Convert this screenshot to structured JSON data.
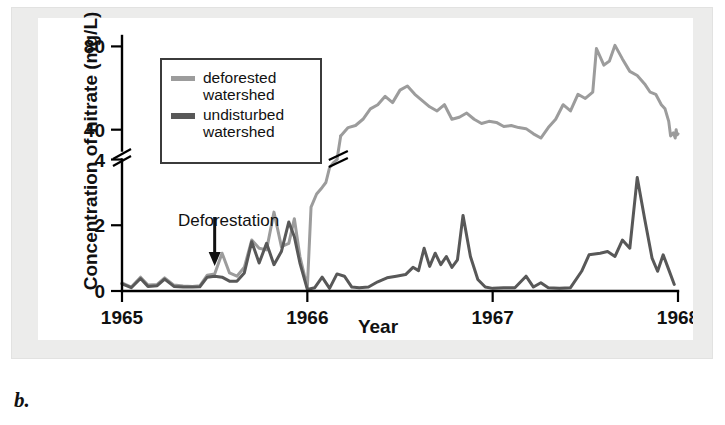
{
  "figure": {
    "panel_label": "b.",
    "legend": {
      "entries": [
        {
          "label_line1": "deforested",
          "label_line2": "watershed",
          "color": "#9c9c9c",
          "name": "deforested-watershed"
        },
        {
          "label_line1": "undisturbed",
          "label_line2": "watershed",
          "color": "#585858",
          "name": "undisturbed-watershed"
        }
      ]
    },
    "annotation": {
      "text": "Deforestation",
      "arrow": "down-arrow",
      "points_to_year": 1965.5
    },
    "colors": {
      "deforested": "#9c9c9c",
      "undisturbed": "#585858",
      "axis": "#000000",
      "frame_background": "#ececeb",
      "plot_background": "#ffffff"
    }
  },
  "chart_data": {
    "type": "line",
    "title": "",
    "xlabel": "Year",
    "ylabel": "Concentration of nitrate (mg/L)",
    "xlim": [
      1965.0,
      1968.0
    ],
    "x_ticks": [
      1965,
      1966,
      1967,
      1968
    ],
    "x_tick_labels": [
      "1965",
      "1966",
      "1967",
      "1968"
    ],
    "y_ticks_lower": [
      0,
      2,
      4
    ],
    "y_ticks_upper": [
      40,
      80
    ],
    "y_tick_labels": [
      "0",
      "2",
      "4",
      "40",
      "80"
    ],
    "axis_break": true,
    "axis_break_note": "y-axis is broken between 4 and 40 mg/L; lower segment spans 0-4, upper segment spans ~30-80",
    "ylim_lower": [
      0,
      4
    ],
    "ylim_upper": [
      30,
      85
    ],
    "grid": false,
    "legend_position": "upper-left-inside",
    "series": [
      {
        "name": "deforested watershed",
        "color": "#9c9c9c",
        "points": [
          [
            1965.0,
            0.25
          ],
          [
            1965.05,
            0.12
          ],
          [
            1965.1,
            0.42
          ],
          [
            1965.14,
            0.18
          ],
          [
            1965.19,
            0.2
          ],
          [
            1965.23,
            0.4
          ],
          [
            1965.28,
            0.18
          ],
          [
            1965.33,
            0.15
          ],
          [
            1965.38,
            0.14
          ],
          [
            1965.42,
            0.16
          ],
          [
            1965.46,
            0.48
          ],
          [
            1965.5,
            0.52
          ],
          [
            1965.54,
            1.15
          ],
          [
            1965.58,
            0.55
          ],
          [
            1965.62,
            0.45
          ],
          [
            1965.66,
            0.72
          ],
          [
            1965.7,
            1.55
          ],
          [
            1965.74,
            1.3
          ],
          [
            1965.78,
            1.25
          ],
          [
            1965.82,
            2.4
          ],
          [
            1965.86,
            1.35
          ],
          [
            1965.9,
            1.45
          ],
          [
            1965.93,
            2.2
          ],
          [
            1965.96,
            1.05
          ],
          [
            1966.0,
            0.1
          ],
          [
            1966.02,
            2.55
          ],
          [
            1966.05,
            2.95
          ],
          [
            1966.08,
            3.15
          ],
          [
            1966.1,
            3.3
          ],
          [
            1966.12,
            3.75
          ],
          [
            1966.14,
            3.9
          ],
          [
            1966.16,
            4.0
          ],
          [
            1966.18,
            37.0
          ],
          [
            1966.22,
            41.0
          ],
          [
            1966.26,
            42.0
          ],
          [
            1966.3,
            45.0
          ],
          [
            1966.34,
            50.0
          ],
          [
            1966.38,
            52.0
          ],
          [
            1966.42,
            56.0
          ],
          [
            1966.46,
            53.0
          ],
          [
            1966.5,
            59.0
          ],
          [
            1966.54,
            61.0
          ],
          [
            1966.58,
            57.0
          ],
          [
            1966.62,
            54.0
          ],
          [
            1966.66,
            51.0
          ],
          [
            1966.7,
            49.0
          ],
          [
            1966.74,
            52.0
          ],
          [
            1966.78,
            45.0
          ],
          [
            1966.82,
            46.0
          ],
          [
            1966.86,
            48.0
          ],
          [
            1966.9,
            45.0
          ],
          [
            1966.94,
            43.0
          ],
          [
            1966.98,
            44.0
          ],
          [
            1967.02,
            43.5
          ],
          [
            1967.06,
            41.5
          ],
          [
            1967.1,
            42.0
          ],
          [
            1967.14,
            41.0
          ],
          [
            1967.18,
            40.5
          ],
          [
            1967.22,
            38.0
          ],
          [
            1967.26,
            36.0
          ],
          [
            1967.3,
            41.0
          ],
          [
            1967.34,
            45.0
          ],
          [
            1967.38,
            52.0
          ],
          [
            1967.42,
            49.0
          ],
          [
            1967.46,
            57.0
          ],
          [
            1967.5,
            55.0
          ],
          [
            1967.54,
            58.0
          ],
          [
            1967.56,
            79.0
          ],
          [
            1967.6,
            71.0
          ],
          [
            1967.63,
            73.0
          ],
          [
            1967.66,
            80.5
          ],
          [
            1967.7,
            74.0
          ],
          [
            1967.74,
            68.0
          ],
          [
            1967.78,
            66.0
          ],
          [
            1967.82,
            62.0
          ],
          [
            1967.85,
            58.0
          ],
          [
            1967.88,
            57.0
          ],
          [
            1967.91,
            52.0
          ],
          [
            1967.93,
            50.0
          ],
          [
            1967.95,
            44.0
          ],
          [
            1967.96,
            37.0
          ],
          [
            1967.975,
            38.5
          ],
          [
            1967.985,
            36.0
          ],
          [
            1967.99,
            40.0
          ],
          [
            1967.995,
            37.5
          ],
          [
            1968.0,
            38.0
          ]
        ]
      },
      {
        "name": "undisturbed watershed",
        "color": "#585858",
        "points": [
          [
            1965.0,
            0.22
          ],
          [
            1965.05,
            0.1
          ],
          [
            1965.1,
            0.38
          ],
          [
            1965.14,
            0.14
          ],
          [
            1965.19,
            0.16
          ],
          [
            1965.23,
            0.36
          ],
          [
            1965.28,
            0.14
          ],
          [
            1965.33,
            0.12
          ],
          [
            1965.38,
            0.12
          ],
          [
            1965.42,
            0.13
          ],
          [
            1965.46,
            0.42
          ],
          [
            1965.5,
            0.45
          ],
          [
            1965.54,
            0.42
          ],
          [
            1965.58,
            0.3
          ],
          [
            1965.62,
            0.3
          ],
          [
            1965.66,
            0.55
          ],
          [
            1965.7,
            1.5
          ],
          [
            1965.74,
            0.85
          ],
          [
            1965.78,
            1.45
          ],
          [
            1965.82,
            0.8
          ],
          [
            1965.86,
            1.2
          ],
          [
            1965.9,
            2.1
          ],
          [
            1965.93,
            1.65
          ],
          [
            1965.96,
            0.85
          ],
          [
            1966.0,
            0.05
          ],
          [
            1966.04,
            0.1
          ],
          [
            1966.08,
            0.42
          ],
          [
            1966.12,
            0.08
          ],
          [
            1966.16,
            0.52
          ],
          [
            1966.2,
            0.45
          ],
          [
            1966.24,
            0.12
          ],
          [
            1966.28,
            0.1
          ],
          [
            1966.33,
            0.12
          ],
          [
            1966.38,
            0.28
          ],
          [
            1966.43,
            0.4
          ],
          [
            1966.48,
            0.45
          ],
          [
            1966.53,
            0.5
          ],
          [
            1966.57,
            0.72
          ],
          [
            1966.6,
            0.62
          ],
          [
            1966.63,
            1.3
          ],
          [
            1966.66,
            0.75
          ],
          [
            1966.69,
            1.15
          ],
          [
            1966.72,
            0.8
          ],
          [
            1966.75,
            1.05
          ],
          [
            1966.78,
            0.72
          ],
          [
            1966.81,
            0.95
          ],
          [
            1966.84,
            2.3
          ],
          [
            1966.88,
            1.05
          ],
          [
            1966.92,
            0.35
          ],
          [
            1966.96,
            0.12
          ],
          [
            1967.0,
            0.08
          ],
          [
            1967.06,
            0.1
          ],
          [
            1967.12,
            0.1
          ],
          [
            1967.18,
            0.45
          ],
          [
            1967.22,
            0.12
          ],
          [
            1967.26,
            0.25
          ],
          [
            1967.3,
            0.1
          ],
          [
            1967.36,
            0.08
          ],
          [
            1967.42,
            0.1
          ],
          [
            1967.48,
            0.6
          ],
          [
            1967.52,
            1.1
          ],
          [
            1967.58,
            1.15
          ],
          [
            1967.62,
            1.2
          ],
          [
            1967.66,
            1.05
          ],
          [
            1967.7,
            1.55
          ],
          [
            1967.74,
            1.3
          ],
          [
            1967.78,
            3.45
          ],
          [
            1967.82,
            2.2
          ],
          [
            1967.86,
            1.0
          ],
          [
            1967.89,
            0.6
          ],
          [
            1967.92,
            1.1
          ],
          [
            1967.95,
            0.65
          ],
          [
            1967.98,
            0.2
          ]
        ]
      }
    ]
  }
}
